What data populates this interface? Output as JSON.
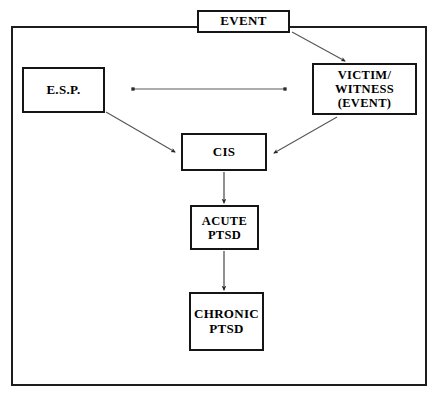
{
  "diagram": {
    "background_color": "#ffffff",
    "line_color": "#151515",
    "frame": {
      "name": "outer-frame",
      "stroke": "#1d1d1d"
    },
    "nodes": [
      {
        "id": "event",
        "label": "EVENT"
      },
      {
        "id": "esp",
        "label": "E.S.P."
      },
      {
        "id": "victim",
        "label": "VICTIM/\nWITNESS\n(EVENT)"
      },
      {
        "id": "cis",
        "label": "CIS"
      },
      {
        "id": "acute",
        "label": "ACUTE\nPTSD"
      },
      {
        "id": "chronic",
        "label": "CHRONIC\nPTSD"
      }
    ],
    "connectors": [
      {
        "id": "event-to-victim",
        "from": "event",
        "to": "victim",
        "style": "arrow",
        "direction": "one-way"
      },
      {
        "id": "esp-to-victim",
        "from": "esp",
        "to": "victim",
        "style": "line",
        "direction": "two-way"
      },
      {
        "id": "esp-to-cis",
        "from": "esp",
        "to": "cis",
        "style": "arrow",
        "direction": "one-way"
      },
      {
        "id": "victim-to-cis",
        "from": "victim",
        "to": "cis",
        "style": "arrow",
        "direction": "one-way"
      },
      {
        "id": "cis-to-acute",
        "from": "cis",
        "to": "acute",
        "style": "arrow",
        "direction": "one-way"
      },
      {
        "id": "acute-to-chronic",
        "from": "acute",
        "to": "chronic",
        "style": "arrow",
        "direction": "one-way"
      }
    ]
  }
}
